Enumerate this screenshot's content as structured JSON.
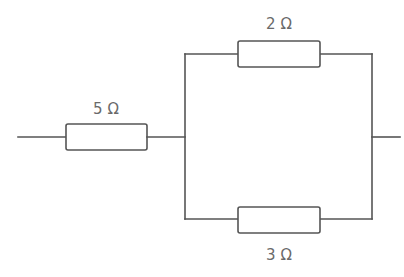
{
  "diagram": {
    "type": "circuit",
    "colors": {
      "line": "#555555",
      "text": "#6a6a6a",
      "background": "#ffffff"
    },
    "resistors": [
      {
        "id": "r1",
        "label": "5 Ω",
        "value_ohms": 5,
        "position": "series"
      },
      {
        "id": "r2",
        "label": "2 Ω",
        "value_ohms": 2,
        "position": "parallel-top"
      },
      {
        "id": "r3",
        "label": "3 Ω",
        "value_ohms": 3,
        "position": "parallel-bottom"
      }
    ]
  }
}
